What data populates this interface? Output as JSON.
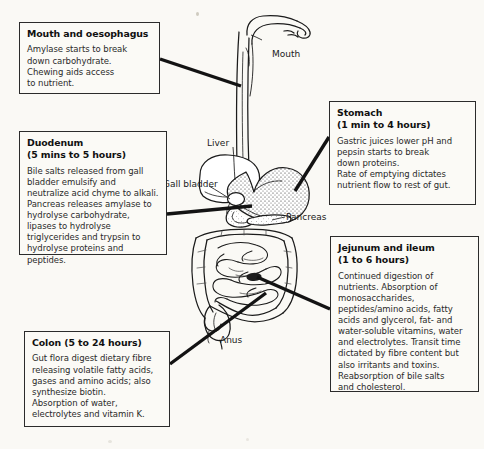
{
  "diagram": {
    "background_color": "#faf9f5",
    "ink_color": "#1a1a1a"
  },
  "boxes": [
    {
      "id": "mouth",
      "heading": "Mouth and oesophagus",
      "subheading": "",
      "lines": [
        "Amylase starts to break",
        "down carbohydrate.",
        "Chewing aids access",
        "to nutrient."
      ]
    },
    {
      "id": "duodenum",
      "heading": "Duodenum",
      "subheading": "(5 mins to 5 hours)",
      "lines": [
        "Bile salts released from gall",
        "bladder emulsify and",
        "neutralize acid chyme to alkali.",
        "Pancreas releases amylase to",
        "hydrolyse carbohydrate,",
        "lipases to hydrolyse",
        "triglycerides and trypsin to",
        "hydrolyse proteins and",
        "peptides."
      ]
    },
    {
      "id": "colon",
      "heading": "Colon (5 to 24 hours)",
      "subheading": "",
      "lines": [
        "Gut flora digest dietary fibre",
        "releasing volatile fatty acids,",
        "gases and amino acids; also",
        "synthesize biotin.",
        "Absorption of water,",
        "electrolytes and vitamin K."
      ]
    },
    {
      "id": "stomach",
      "heading": "Stomach",
      "subheading": "(1 min to 4 hours)",
      "lines": [
        "Gastric juices lower pH and",
        "pepsin starts to break",
        "down proteins.",
        "Rate of emptying dictates",
        "nutrient flow to rest of gut."
      ]
    },
    {
      "id": "jejunum",
      "heading": "Jejunum and ileum",
      "subheading": "(1 to 6 hours)",
      "lines": [
        "Continued digestion of",
        "nutrients. Absorption of",
        "monosaccharides,",
        "peptides/amino acids, fatty",
        "acids and glycerol, fat- and",
        "water-soluble vitamins, water",
        "and electrolytes. Transit time",
        "dictated by fibre content but",
        "also irritants and toxins.",
        "Reabsorption of bile salts",
        "and cholesterol."
      ]
    }
  ],
  "anatomy_labels": [
    {
      "id": "mouth",
      "text": "Mouth"
    },
    {
      "id": "liver",
      "text": "Liver"
    },
    {
      "id": "gall_bladder",
      "text": "Gall bladder"
    },
    {
      "id": "pancreas",
      "text": "Pancreas"
    },
    {
      "id": "anus",
      "text": "Anus"
    }
  ],
  "connectors": [
    {
      "from_box": "mouth",
      "to_organ": "oesophagus"
    },
    {
      "from_box": "duodenum",
      "to_organ": "duodenum"
    },
    {
      "from_box": "colon",
      "to_organ": "colon"
    },
    {
      "from_box": "stomach",
      "to_organ": "stomach"
    },
    {
      "from_box": "jejunum",
      "to_organ": "small-intestine"
    }
  ]
}
